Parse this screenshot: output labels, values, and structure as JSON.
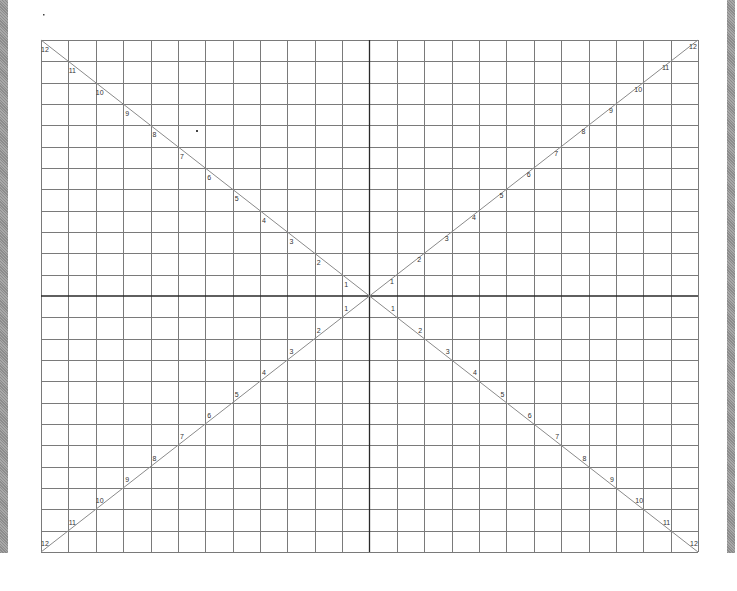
{
  "diagram": {
    "type": "grid with diagonal scales",
    "grid": {
      "columns": 24,
      "rows": 24
    },
    "colors": {
      "background": "#ffffff",
      "grid_line": "#7a7a7a",
      "axis_line": "#2a2a2a",
      "diagonal_line": "#8a8a8a",
      "label_text": "#333333",
      "side_bar": "#9a9a9a"
    },
    "diagonals": [
      {
        "name": "upper-left",
        "labels": [
          "1",
          "2",
          "3",
          "4",
          "5",
          "6",
          "7",
          "8",
          "9",
          "10",
          "11",
          "12"
        ]
      },
      {
        "name": "upper-right",
        "labels": [
          "1",
          "2",
          "3",
          "4",
          "5",
          "6",
          "7",
          "8",
          "9",
          "10",
          "11",
          "12"
        ]
      },
      {
        "name": "lower-left",
        "labels": [
          "1",
          "2",
          "3",
          "4",
          "5",
          "6",
          "7",
          "8",
          "9",
          "10",
          "11",
          "12"
        ]
      },
      {
        "name": "lower-right",
        "labels": [
          "1",
          "2",
          "3",
          "4",
          "5",
          "6",
          "7",
          "8",
          "9",
          "10",
          "11",
          "12"
        ]
      }
    ]
  }
}
